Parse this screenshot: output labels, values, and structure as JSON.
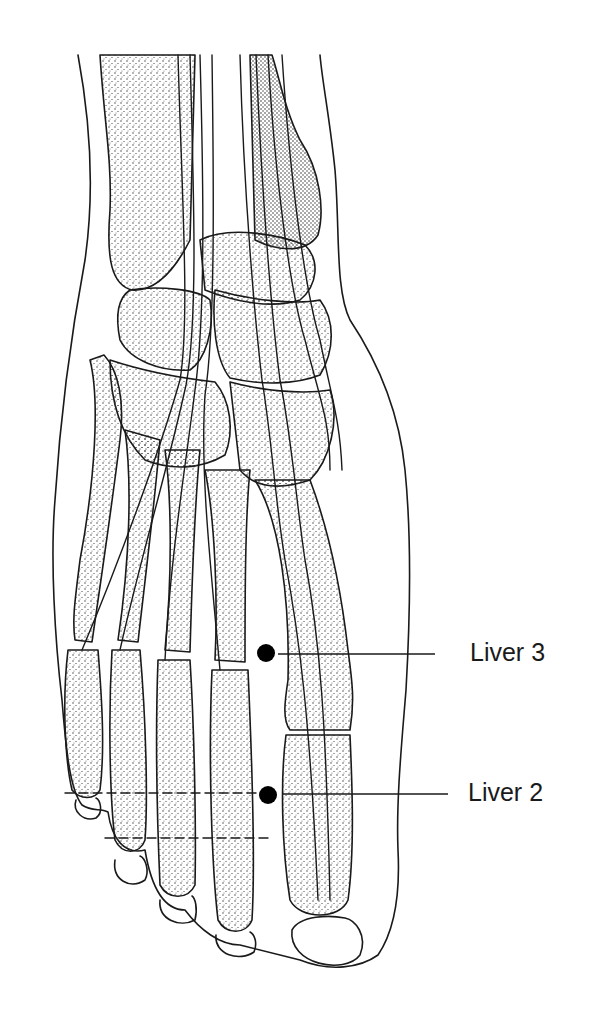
{
  "figure": {
    "colors": {
      "ink": "#1a1a1a",
      "background": "#ffffff",
      "point": "#000000"
    }
  },
  "points": [
    {
      "id": "liver-3",
      "label": "Liver 3",
      "dot": {
        "x": 266,
        "y": 653
      },
      "leader_end": {
        "x": 435,
        "y": 654
      }
    },
    {
      "id": "liver-2",
      "label": "Liver 2",
      "dot": {
        "x": 268,
        "y": 795
      },
      "leader_end": {
        "x": 448,
        "y": 794
      }
    }
  ]
}
